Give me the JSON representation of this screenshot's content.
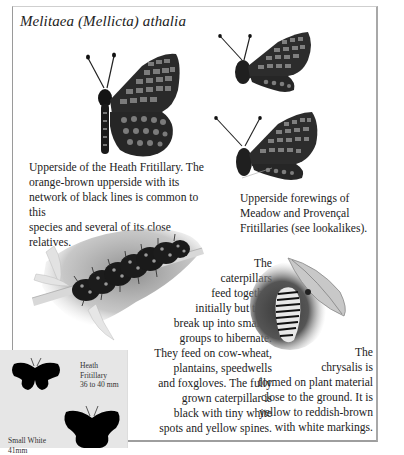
{
  "page": {
    "species_title": "Melitaea (Mellicta) athalia"
  },
  "illustrations": {
    "main_butterfly": "heath-fritillary-upperside",
    "side_butterfly_top": "meadow-fritillary-forewing",
    "side_butterfly_bottom": "provencal-fritillary-forewing",
    "caterpillar": "caterpillar-on-stem",
    "chrysalis": "chrysalis-on-plant"
  },
  "captions": {
    "main": "Upperside of the Heath Fritillary. The\norange-brown upperside with its\nnetwork of black lines is common to this\nspecies and several of its close relatives.",
    "forewings": "Upperside forewings of\nMeadow and Provençal\nFritillaries (see lookalikes).",
    "caterpillar": "The\ncaterpillars\nfeed together\ninitially but then\nbreak up into smaller\ngroups to hibernate.\nThey feed on cow-wheat,\nplantains, speedwells\nand foxgloves. The fully\ngrown caterpillar is\nblack with tiny white\nspots and yellow spines.",
    "chrysalis": "The\nchrysalis is\nformed on plant material\nclose to the ground. It is\nyellow to reddish-brown\nwith white markings."
  },
  "size_comparison": {
    "heath_label": "Heath\nFritillary\n36 to 40 mm",
    "small_white_label": "Small White\n41mm"
  },
  "colors": {
    "text": "#222222",
    "frame_border": "#a0a0a0",
    "scale_box_bg": "#e6e6e6",
    "silhouette": "#000000"
  }
}
